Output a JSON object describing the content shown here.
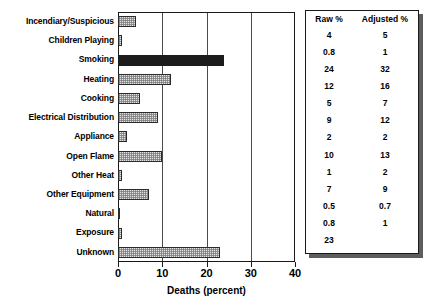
{
  "chart_data": {
    "type": "bar",
    "orientation": "horizontal",
    "title": "",
    "xlabel": "Deaths (percent)",
    "ylabel": "",
    "xlim": [
      0,
      40
    ],
    "xticks": [
      0,
      10,
      20,
      30,
      40
    ],
    "grid": true,
    "grid_axis": "x",
    "legend": "none",
    "categories": [
      "Incendiary/Suspicious",
      "Children Playing",
      "Smoking",
      "Heating",
      "Cooking",
      "Electrical Distribution",
      "Appliance",
      "Open Flame",
      "Other Heat",
      "Other Equipment",
      "Natural",
      "Exposure",
      "Unknown"
    ],
    "values": [
      4,
      0.8,
      24,
      12,
      5,
      9,
      2,
      10,
      1,
      7,
      0.5,
      0.8,
      23
    ],
    "highlight_index": 2,
    "highlight_color": "#1c1c1c",
    "bar_color": "#e4e4e4",
    "bar_edge_color": "#2b2b2b"
  },
  "table": {
    "headers": [
      "Raw %",
      "Adjusted %"
    ],
    "rows": [
      {
        "raw": "4",
        "adjusted": "5"
      },
      {
        "raw": "0.8",
        "adjusted": "1"
      },
      {
        "raw": "24",
        "adjusted": "32"
      },
      {
        "raw": "12",
        "adjusted": "16"
      },
      {
        "raw": "5",
        "adjusted": "7"
      },
      {
        "raw": "9",
        "adjusted": "12"
      },
      {
        "raw": "2",
        "adjusted": "2"
      },
      {
        "raw": "10",
        "adjusted": "13"
      },
      {
        "raw": "1",
        "adjusted": "2"
      },
      {
        "raw": "7",
        "adjusted": "9"
      },
      {
        "raw": "0.5",
        "adjusted": "0.7"
      },
      {
        "raw": "0.8",
        "adjusted": "1"
      },
      {
        "raw": "23",
        "adjusted": ""
      }
    ]
  }
}
